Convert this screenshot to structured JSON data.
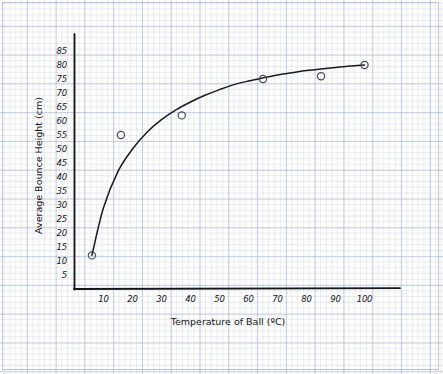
{
  "chart_data": {
    "type": "scatter",
    "title": "",
    "xlabel": "Temperature of Ball (ºC)",
    "ylabel": "Average Bounce Height (cm)",
    "xlim": [
      0,
      110
    ],
    "ylim": [
      0,
      87
    ],
    "xticks": [
      10,
      20,
      30,
      40,
      50,
      60,
      70,
      80,
      90,
      100
    ],
    "yticks": [
      5,
      10,
      15,
      20,
      25,
      30,
      35,
      40,
      45,
      50,
      55,
      60,
      65,
      70,
      75,
      80,
      85
    ],
    "grid": true,
    "grid_style": "graph-paper",
    "legend": "none",
    "points": [
      {
        "x": 6,
        "y": 12
      },
      {
        "x": 16,
        "y": 55
      },
      {
        "x": 37,
        "y": 62
      },
      {
        "x": 65,
        "y": 75
      },
      {
        "x": 85,
        "y": 76
      },
      {
        "x": 100,
        "y": 80
      }
    ],
    "series": [
      {
        "name": "Average bounce height",
        "marker": "open-circle",
        "values": [
          12,
          55,
          62,
          75,
          76,
          80
        ]
      }
    ],
    "fit_curve": {
      "name": "line of best fit",
      "style": "smooth-curve",
      "x": [
        6,
        10,
        15,
        20,
        25,
        30,
        35,
        40,
        45,
        50,
        55,
        60,
        65,
        70,
        75,
        80,
        85,
        90,
        95,
        100
      ],
      "y": [
        12,
        29,
        42,
        50,
        56,
        60.5,
        64,
        66.8,
        69.2,
        71.2,
        73,
        74.3,
        75.4,
        76.4,
        77.2,
        78,
        78.6,
        79.1,
        79.6,
        80
      ]
    },
    "colors": {
      "axis": "#15151a",
      "curve": "#1a1a1f",
      "marker": "#4a4a52",
      "grid_major": "#96a5c3",
      "grid_minor": "#c8d2e4",
      "paper": "#fdfdfb"
    }
  },
  "axis_titles": {
    "x": "Temperature of Ball (ºC)",
    "y": "Average Bounce Height (cm)"
  }
}
